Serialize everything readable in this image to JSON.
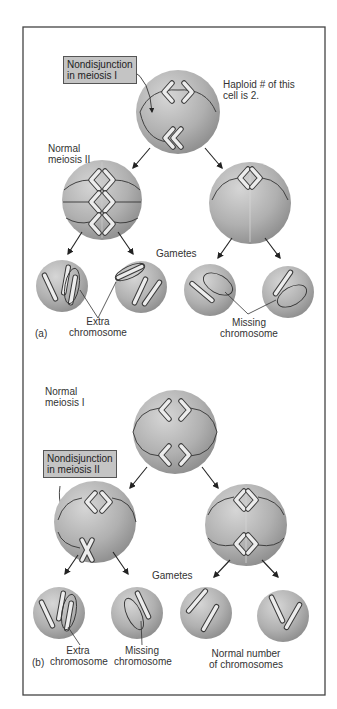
{
  "figure": {
    "part_a": {
      "label": "(a)",
      "callout": [
        "Nondisjunction",
        "in meiosis I"
      ],
      "note": [
        "Haploid # of this",
        "cell is 2."
      ],
      "stage_label": [
        "Normal",
        "meiosis II"
      ],
      "gametes_label": "Gametes",
      "extra_label": [
        "Extra",
        "chromosome"
      ],
      "missing_label": [
        "Missing",
        "chromosome"
      ]
    },
    "part_b": {
      "label": "(b)",
      "stage_label": [
        "Normal",
        "meiosis I"
      ],
      "callout": [
        "Nondisjunction",
        "in meiosis II"
      ],
      "gametes_label": "Gametes",
      "extra_label": [
        "Extra",
        "chromosome"
      ],
      "missing_label": [
        "Missing",
        "chromosome"
      ],
      "normal_label": [
        "Normal number",
        "of chromosomes"
      ]
    }
  },
  "colors": {
    "cell_light": "#d2d2d2",
    "cell_dark": "#8e8e8e",
    "chromosome": "#ececec",
    "outline": "#3a3a3a",
    "callout_bg": "#c4c4c4",
    "frame": "#444444"
  }
}
